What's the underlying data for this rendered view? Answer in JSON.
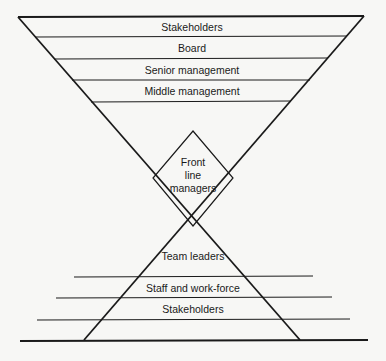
{
  "diagram": {
    "top_funnel": {
      "layers": [
        {
          "label": "Stakeholders"
        },
        {
          "label": "Board"
        },
        {
          "label": "Senior management"
        },
        {
          "label": "Middle management"
        }
      ]
    },
    "center": {
      "line1": "Front",
      "line2": "line",
      "line3": "managers"
    },
    "bottom_pyramid": {
      "layers": [
        {
          "label": "Team leaders"
        },
        {
          "label": "Staff and work-force"
        },
        {
          "label": "Stakeholders"
        }
      ]
    },
    "colors": {
      "line": "#1a1a1a",
      "background": "#f7f7f5"
    }
  }
}
